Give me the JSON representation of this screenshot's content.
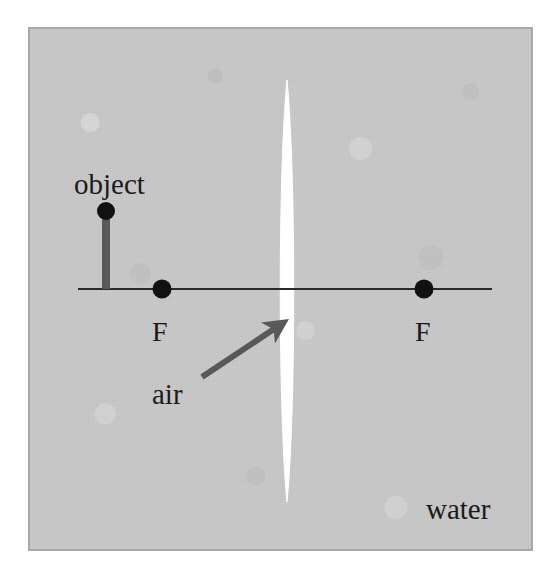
{
  "figure": {
    "kind": "optics-ray-diagram",
    "caption_absent": true,
    "panel": {
      "background_color": "#c9c9c9",
      "border_color": "#a9a9a9",
      "texture": "scanned paper grain"
    }
  },
  "labels": {
    "object": "object",
    "focal_point_left": "F",
    "focal_point_right": "F",
    "air": "air",
    "water": "water"
  },
  "colors": {
    "background": "#c9c9c9",
    "border": "#a9a9a9",
    "lens_fill": "#ffffff",
    "axis_line": "#2a2a2a",
    "object_bar": "#595959",
    "object_dot": "#111111",
    "focal_dot": "#111111",
    "pointer_arrow": "#585858",
    "text": "#1a1a1a"
  },
  "chart_data": {
    "type": "diagram",
    "media": {
      "inside_lens": "air",
      "surrounding": "water"
    },
    "elements": [
      {
        "name": "principal-axis",
        "type": "line",
        "x1": 48,
        "y1": 260,
        "x2": 462,
        "y2": 260,
        "stroke": "#2a2a2a",
        "stroke_width": 2.2
      },
      {
        "name": "lens",
        "type": "lens",
        "shape": "biconvex",
        "center_x": 257,
        "center_y": 262,
        "half_height": 211,
        "half_width": 9,
        "fill": "#ffffff"
      },
      {
        "name": "object",
        "type": "arrow-object",
        "x": 76,
        "base_y": 260,
        "tip_y": 182,
        "height": 78,
        "bar_width": 8,
        "head_radius": 9,
        "bar_color": "#595959",
        "head_color": "#111111"
      },
      {
        "name": "focal-point-left",
        "type": "point",
        "x": 132,
        "y": 260,
        "radius": 9.5,
        "label": "F"
      },
      {
        "name": "focal-point-right",
        "type": "point",
        "x": 394,
        "y": 260,
        "radius": 9.5,
        "label": "F"
      },
      {
        "name": "air-pointer-arrow",
        "type": "arrow",
        "x1": 172,
        "y1": 348,
        "x2": 256,
        "y2": 292,
        "stroke": "#585858",
        "stroke_width": 6,
        "head": "filled-triangle"
      }
    ],
    "annotations": [
      {
        "text": "object",
        "x": 44,
        "y": 141,
        "anchor": "start"
      },
      {
        "text": "F",
        "x": 132,
        "y": 300,
        "anchor": "middle"
      },
      {
        "text": "F",
        "x": 394,
        "y": 300,
        "anchor": "middle"
      },
      {
        "text": "air",
        "x": 122,
        "y": 351,
        "anchor": "start"
      },
      {
        "text": "water",
        "x": 396,
        "y": 466,
        "anchor": "start"
      }
    ]
  }
}
